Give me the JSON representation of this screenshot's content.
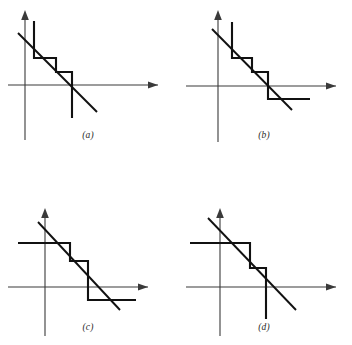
{
  "figure": {
    "panel_count": 4,
    "background_color": "#ffffff",
    "ink_color": "#111111",
    "axis_color": "#3a3a3a"
  },
  "panels": [
    {
      "id": "a",
      "caption": "(a)",
      "axes": {
        "origin_x": 25,
        "origin_y": 85,
        "x_axis": "M 8 85 L 158 85",
        "x_arrow": "158,85 148,81.5 148,88.5",
        "y_axis": "M 25 140 L 25 14",
        "y_arrow": "25,10 21.2,20 28.8,20"
      },
      "staircase_path": "M 34 21 L 34 58 L 56 58 L 56 72 L 72 72 L 72 85 L 72 118",
      "diagonal_path": "M 18 33 L 97 112"
    },
    {
      "id": "b",
      "caption": "(b)",
      "axes": {
        "origin_x": 42,
        "origin_y": 86,
        "x_axis": "M 10 86 L 160 86",
        "x_arrow": "160,86 150,82.5 150,89.5",
        "y_axis": "M 42 142 L 42 14",
        "y_arrow": "42,10 38.2,20 45.8,20"
      },
      "staircase_path": "M 56 22 L 56 58 L 76 58 L 76 72 L 92 72 L 92 86 L 92 99 L 134 99",
      "diagonal_path": "M 36 29 L 116 110"
    },
    {
      "id": "c",
      "caption": "(c)",
      "axes": {
        "origin_x": 45,
        "origin_y": 93,
        "x_axis": "M 8 93 L 148 93",
        "x_arrow": "148,93 138,89.5 138,96.5",
        "y_axis": "M 45 142 L 45 18",
        "y_arrow": "45,14 41.2,24 48.8,24"
      },
      "staircase_path": "M 18 49 L 70 49 L 70 67 L 88 67 L 88 93 L 88 106 L 136 106",
      "diagonal_path": "M 38 28 L 120 116"
    },
    {
      "id": "d",
      "caption": "(d)",
      "axes": {
        "origin_x": 44,
        "origin_y": 93,
        "x_axis": "M 10 93 L 160 93",
        "x_arrow": "160,93 150,89.5 150,96.5",
        "y_axis": "M 44 142 L 44 18",
        "y_arrow": "44,14 40.2,24 47.8,24"
      },
      "staircase_path": "M 14 49 L 74 49 L 74 74 L 90 74 L 90 93 L 90 125",
      "diagonal_path": "M 32 24 L 120 116"
    }
  ]
}
